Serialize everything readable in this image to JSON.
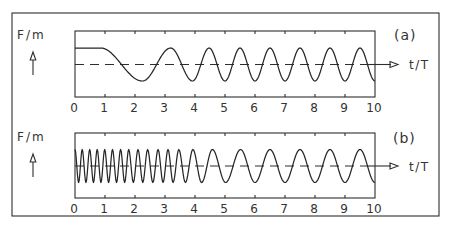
{
  "figure": {
    "panels": [
      {
        "tag": "(a)",
        "ylabel": "F/m",
        "xlabel": "t/T",
        "ticks": [
          "0",
          "1",
          "2",
          "3",
          "4",
          "5",
          "6",
          "7",
          "8",
          "9",
          "10"
        ]
      },
      {
        "tag": "(b)",
        "ylabel": "F/m",
        "xlabel": "t/T",
        "ticks": [
          "0",
          "1",
          "2",
          "3",
          "4",
          "5",
          "6",
          "7",
          "8",
          "9",
          "10"
        ]
      }
    ],
    "colors": {
      "line": "#2e2e2e",
      "background": "#ffffff"
    }
  },
  "chart_data": [
    {
      "type": "line",
      "title": "(a)",
      "xlabel": "t/T",
      "ylabel": "F/m",
      "xlim": [
        0,
        10
      ],
      "ylim": [
        -1,
        1
      ],
      "x_ticks": [
        0,
        1,
        2,
        3,
        4,
        5,
        6,
        7,
        8,
        9,
        10
      ],
      "grid": false,
      "baseline": {
        "y": 0,
        "style": "dashed"
      },
      "series": [
        {
          "name": "F/m (frequency rising from 0 to steady state)",
          "extrema_t_y": [
            [
              0,
              1
            ],
            [
              0.85,
              1
            ],
            [
              2.25,
              -1
            ],
            [
              3.19,
              1
            ],
            [
              3.92,
              -1
            ],
            [
              4.47,
              1
            ],
            [
              5.0,
              -1
            ],
            [
              5.5,
              1
            ],
            [
              6.0,
              -1
            ],
            [
              6.5,
              1
            ],
            [
              7.0,
              -1
            ],
            [
              7.5,
              1
            ],
            [
              8.0,
              -1
            ],
            [
              8.5,
              1
            ],
            [
              9.0,
              -1
            ],
            [
              9.5,
              1
            ],
            [
              10.0,
              -1
            ]
          ]
        }
      ]
    },
    {
      "type": "line",
      "title": "(b)",
      "xlabel": "t/T",
      "ylabel": "F/m",
      "xlim": [
        0,
        10
      ],
      "ylim": [
        -1,
        1
      ],
      "x_ticks": [
        0,
        1,
        2,
        3,
        4,
        5,
        6,
        7,
        8,
        9,
        10
      ],
      "grid": false,
      "baseline": {
        "y": 0,
        "style": "dashed"
      },
      "series": [
        {
          "name": "F/m (high initial frequency decaying to steady state)",
          "extrema_t_y": [
            [
              0,
              1
            ],
            [
              0.12,
              -1
            ],
            [
              0.24,
              1
            ],
            [
              0.365,
              -1
            ],
            [
              0.49,
              1
            ],
            [
              0.615,
              -1
            ],
            [
              0.74,
              1
            ],
            [
              0.865,
              -1
            ],
            [
              0.99,
              1
            ],
            [
              1.12,
              -1
            ],
            [
              1.25,
              1
            ],
            [
              1.385,
              -1
            ],
            [
              1.52,
              1
            ],
            [
              1.655,
              -1
            ],
            [
              1.79,
              1
            ],
            [
              1.945,
              -1
            ],
            [
              2.1,
              1
            ],
            [
              2.26,
              -1
            ],
            [
              2.42,
              1
            ],
            [
              2.595,
              -1
            ],
            [
              2.77,
              1
            ],
            [
              2.935,
              -1
            ],
            [
              3.1,
              1
            ],
            [
              3.27,
              -1
            ],
            [
              3.46,
              1
            ],
            [
              3.68,
              -1
            ],
            [
              3.93,
              1
            ],
            [
              4.22,
              -1
            ],
            [
              4.58,
              1
            ],
            [
              5.02,
              -1
            ],
            [
              5.52,
              1
            ],
            [
              6.0,
              -1
            ],
            [
              6.5,
              1
            ],
            [
              7.0,
              -1
            ],
            [
              7.5,
              1
            ],
            [
              8.0,
              -1
            ],
            [
              8.5,
              1
            ],
            [
              9.0,
              -1
            ],
            [
              9.5,
              1
            ],
            [
              10.0,
              -1
            ]
          ]
        }
      ]
    }
  ]
}
